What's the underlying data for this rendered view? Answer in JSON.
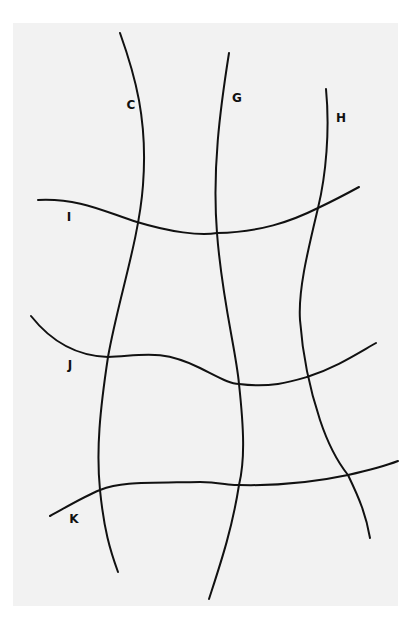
{
  "diagram": {
    "background": "#f2f2f2",
    "stroke_color": "#111111",
    "curves": [
      {
        "id": "C",
        "label": "C",
        "orientation": "vertical",
        "label_pos": [
          131,
          105
        ],
        "path": "M120,33 C135,75 148,120 143,185 C139,240 118,300 108,357 C100,410 96,450 100,490 C104,530 110,550 118,572"
      },
      {
        "id": "G",
        "label": "G",
        "orientation": "vertical",
        "label_pos": [
          237,
          98
        ],
        "path": "M229,53 C220,110 212,170 217,233 C222,300 236,350 239,384 C244,430 245,460 239,485 C232,530 220,565 209,599"
      },
      {
        "id": "H",
        "label": "H",
        "orientation": "vertical",
        "label_pos": [
          341,
          118
        ],
        "path": "M326,89 C330,130 326,175 318,208 C308,250 298,290 300,320 C303,360 310,390 320,420 C330,450 340,465 348,475 C360,500 366,515 370,538"
      },
      {
        "id": "I",
        "label": "I",
        "orientation": "horizontal",
        "label_pos": [
          69,
          217
        ],
        "path": "M38,200 C80,198 105,212 137,222 C170,232 200,236 217,233 C260,232 290,222 318,208 C335,200 348,193 359,187"
      },
      {
        "id": "J",
        "label": "J",
        "orientation": "horizontal",
        "label_pos": [
          70,
          365
        ],
        "path": "M31,316 C50,340 75,356 108,357 C140,356 160,348 200,368 C220,378 230,384 239,384 C270,388 290,382 307,377 C335,368 355,355 376,343"
      },
      {
        "id": "K",
        "label": "K",
        "orientation": "horizontal",
        "label_pos": [
          74,
          519
        ],
        "path": "M50,516 C70,505 85,496 100,490 C120,482 140,483 200,482 C220,482 230,486 239,485 C280,486 320,481 348,475 C370,470 385,466 398,461"
      }
    ]
  }
}
